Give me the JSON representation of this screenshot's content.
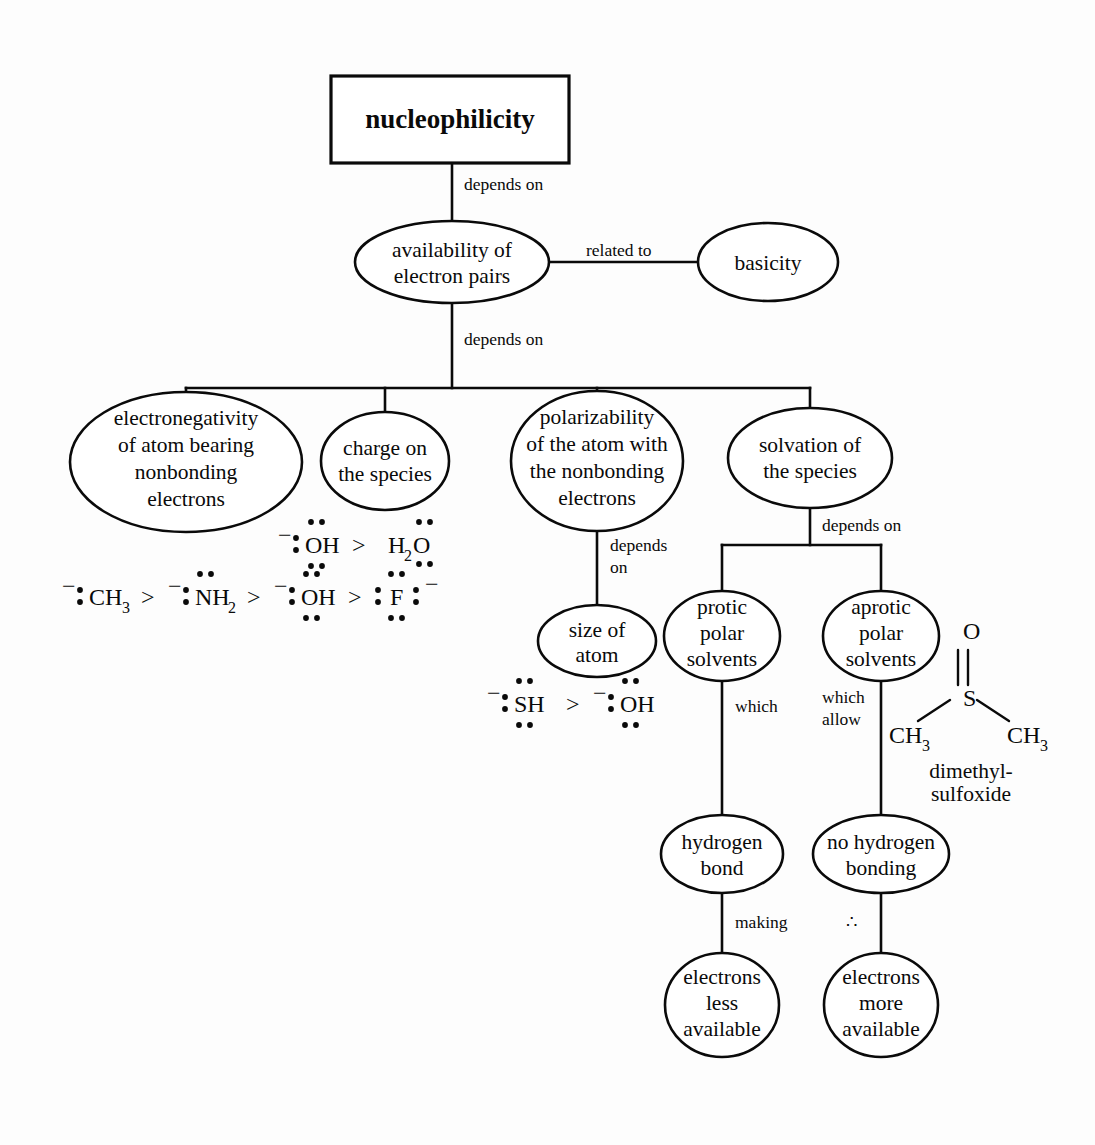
{
  "document": {
    "kind": "concept-map",
    "title": "nucleophilicity",
    "background_color": "#fdfdfd",
    "ink_color": "#0a0a0a"
  },
  "nodes": {
    "root": {
      "label": "nucleophilicity",
      "shape": "rectangle"
    },
    "availability": {
      "line1": "availability of",
      "line2": "electron pairs",
      "shape": "ellipse"
    },
    "basicity": {
      "label": "basicity",
      "shape": "ellipse"
    },
    "electronegativity": {
      "line1": "electronegativity",
      "line2": "of atom bearing",
      "line3": "nonbonding",
      "line4": "electrons",
      "shape": "ellipse"
    },
    "charge": {
      "line1": "charge on",
      "line2": "the species",
      "shape": "ellipse"
    },
    "polarizability": {
      "line1": "polarizability",
      "line2": "of the atom with",
      "line3": "the nonbonding",
      "line4": "electrons",
      "shape": "ellipse"
    },
    "solvation": {
      "line1": "solvation of",
      "line2": "the species",
      "shape": "ellipse"
    },
    "size_of_atom": {
      "line1": "size of",
      "line2": "atom",
      "shape": "ellipse"
    },
    "protic": {
      "line1": "protic",
      "line2": "polar",
      "line3": "solvents",
      "shape": "ellipse"
    },
    "aprotic": {
      "line1": "aprotic",
      "line2": "polar",
      "line3": "solvents",
      "shape": "ellipse"
    },
    "hydrogen_bond": {
      "line1": "hydrogen",
      "line2": "bond",
      "shape": "ellipse"
    },
    "no_hydrogen_bonding": {
      "line1": "no hydrogen",
      "line2": "bonding",
      "shape": "ellipse"
    },
    "electrons_less": {
      "line1": "electrons",
      "line2": "less",
      "line3": "available",
      "shape": "ellipse"
    },
    "electrons_more": {
      "line1": "electrons",
      "line2": "more",
      "line3": "available",
      "shape": "ellipse"
    }
  },
  "link_labels": {
    "root_to_availability": "depends on",
    "availability_to_basicity": "related to",
    "availability_to_row": "depends on",
    "polarizability_to_size_line1": "depends",
    "polarizability_to_size_line2": "on",
    "solvation_to_solvents": "depends on",
    "protic_to_hbond": "which",
    "aprotic_to_nohbond_line1": "which",
    "aprotic_to_nohbond_line2": "allow",
    "hbond_to_less": "making",
    "nohbond_to_more": "∴"
  },
  "chem_annotations": {
    "charge_series": {
      "description": "hydroxide more nucleophilic than water",
      "text": "⁻:ÖH > H₂Ö",
      "parts": [
        "⁻",
        ":",
        "OH",
        ">",
        "H",
        "2",
        "O"
      ]
    },
    "electronegativity_series": {
      "description": "nucleophilicity decreases across a period",
      "text": "⁻:CH₃ > ⁻:N̈H₂ > ⁻:ÖH > :F̈:⁻",
      "parts": [
        "⁻",
        ":",
        "CH",
        "3",
        ">",
        "⁻",
        ":",
        "NH",
        "2",
        ">",
        "⁻",
        ":",
        "OH",
        ">",
        ":",
        "F",
        ":",
        "⁻"
      ]
    },
    "size_series": {
      "description": "thiolate more nucleophilic than hydroxide",
      "text": "⁻:S̈H > ⁻:ÖH",
      "parts": [
        "⁻",
        ":",
        "SH",
        ">",
        "⁻",
        ":",
        "OH"
      ]
    },
    "dmso": {
      "atom_o": "O",
      "atom_s": "S",
      "methyl_left": "CH",
      "methyl_left_sub": "3",
      "methyl_right": "CH",
      "methyl_right_sub": "3",
      "name_line1": "dimethyl-",
      "name_line2": "sulfoxide",
      "bond_type": "double"
    }
  }
}
